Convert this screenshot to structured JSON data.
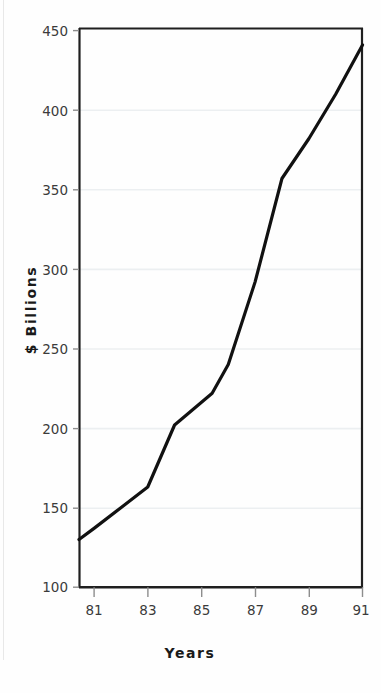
{
  "chart_data": {
    "type": "line",
    "title": "",
    "xlabel": "Years",
    "ylabel": "$ Billions",
    "xlim": [
      80.44,
      91
    ],
    "ylim": [
      100,
      450
    ],
    "xticks": [
      "81",
      "83",
      "85",
      "87",
      "89",
      "91"
    ],
    "xtick_values": [
      81,
      83,
      85,
      87,
      89,
      91
    ],
    "yticks": [
      "100",
      "150",
      "200",
      "250",
      "300",
      "350",
      "400",
      "450"
    ],
    "ytick_values": [
      100,
      150,
      200,
      250,
      300,
      350,
      400,
      450
    ],
    "grid": true,
    "grid_axis": "y",
    "legend": "none",
    "series": [
      {
        "name": "",
        "color": "#111111",
        "line_width": 3.2,
        "x": [
          80.44,
          81,
          82,
          83,
          84,
          85.4,
          86,
          87,
          88,
          89,
          90,
          91
        ],
        "values": [
          130,
          137,
          150,
          163,
          202,
          222,
          240,
          292,
          357,
          382,
          410,
          441
        ]
      }
    ]
  },
  "axes": {
    "y_axis_label": "$ Billions",
    "x_axis_label": "Years",
    "frame_color": "#1f1f1f",
    "gridline_color": "#eceff1",
    "tick_color": "#9a9a9a",
    "label_color": "#3b3b3b"
  }
}
